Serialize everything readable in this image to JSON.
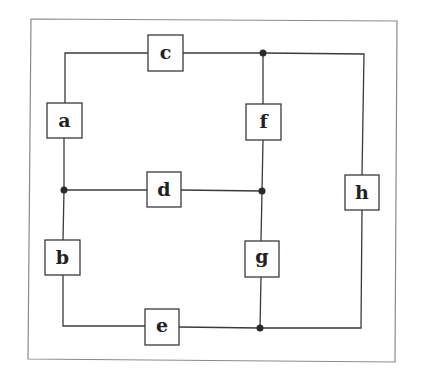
{
  "diagram": {
    "type": "circuit-network",
    "colors": {
      "line": "#3a3a3a",
      "frame": "#8a8a8a",
      "text": "#222222",
      "background": "#ffffff"
    },
    "frame": {
      "x1": 31,
      "y1": 19,
      "x2": 397,
      "y2": 362
    },
    "components": [
      {
        "id": "c",
        "label": "c",
        "x": 148,
        "y": 35,
        "w": 35,
        "h": 36
      },
      {
        "id": "a",
        "label": "a",
        "x": 47,
        "y": 103,
        "w": 35,
        "h": 35
      },
      {
        "id": "f",
        "label": "f",
        "x": 246,
        "y": 104,
        "w": 35,
        "h": 36
      },
      {
        "id": "d",
        "label": "d",
        "x": 147,
        "y": 172,
        "w": 34,
        "h": 35
      },
      {
        "id": "h",
        "label": "h",
        "x": 345,
        "y": 175,
        "w": 34,
        "h": 35
      },
      {
        "id": "b",
        "label": "b",
        "x": 45,
        "y": 240,
        "w": 35,
        "h": 35
      },
      {
        "id": "g",
        "label": "g",
        "x": 245,
        "y": 241,
        "w": 34,
        "h": 36
      },
      {
        "id": "e",
        "label": "e",
        "x": 145,
        "y": 309,
        "w": 34,
        "h": 36
      }
    ],
    "junctions": [
      {
        "id": "j-top",
        "x": 263,
        "y": 53
      },
      {
        "id": "j-mid-left",
        "x": 64,
        "y": 190
      },
      {
        "id": "j-mid-right",
        "x": 262,
        "y": 191
      },
      {
        "id": "j-bottom",
        "x": 260,
        "y": 328
      }
    ]
  }
}
